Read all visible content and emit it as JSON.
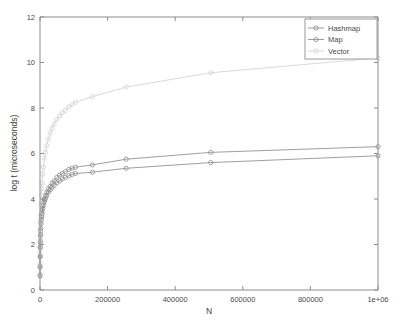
{
  "chart_data": {
    "type": "line",
    "title": "",
    "xlabel": "N",
    "ylabel": "log t (microseconds)",
    "xlim": [
      0,
      1000000
    ],
    "ylim": [
      0,
      12
    ],
    "grid": false,
    "legend_position": "top-right",
    "xticks": [
      0,
      200000,
      400000,
      600000,
      800000,
      1000000
    ],
    "xtick_labels": [
      "0",
      "200000",
      "400000",
      "600000",
      "800000",
      "1e+06"
    ],
    "yticks": [
      0,
      2,
      4,
      6,
      8,
      10,
      12
    ],
    "ytick_labels": [
      "0",
      "2",
      "4",
      "6",
      "8",
      "10",
      "12"
    ],
    "series": [
      {
        "name": "Hashmap",
        "color": "#8e8e8e",
        "marker": "circle",
        "x": [
          100,
          200,
          400,
          700,
          1000,
          1500,
          2000,
          3000,
          4000,
          5000,
          6000,
          8000,
          10000,
          13000,
          16000,
          20000,
          25000,
          30000,
          36000,
          42000,
          50000,
          58000,
          66000,
          75000,
          85000,
          95000,
          105000,
          155000,
          255000,
          505000,
          1000000
        ],
        "y": [
          0.65,
          1.05,
          1.5,
          1.9,
          2.15,
          2.45,
          2.7,
          3.0,
          3.2,
          3.35,
          3.5,
          3.7,
          3.85,
          4.0,
          4.15,
          4.3,
          4.45,
          4.55,
          4.7,
          4.8,
          4.95,
          5.05,
          5.12,
          5.2,
          5.3,
          5.35,
          5.4,
          5.5,
          5.75,
          6.05,
          6.3
        ]
      },
      {
        "name": "Map",
        "color": "#8e8e8e",
        "marker": "circle",
        "x": [
          100,
          200,
          400,
          700,
          1000,
          1500,
          2000,
          3000,
          4000,
          5000,
          6000,
          8000,
          10000,
          13000,
          16000,
          20000,
          25000,
          30000,
          36000,
          42000,
          50000,
          58000,
          66000,
          75000,
          85000,
          95000,
          105000,
          155000,
          255000,
          505000,
          1000000
        ],
        "y": [
          0.62,
          1.0,
          1.45,
          1.85,
          2.08,
          2.38,
          2.6,
          2.9,
          3.1,
          3.25,
          3.38,
          3.58,
          3.72,
          3.88,
          4.0,
          4.15,
          4.3,
          4.4,
          4.5,
          4.6,
          4.72,
          4.8,
          4.88,
          4.95,
          5.02,
          5.08,
          5.12,
          5.18,
          5.35,
          5.6,
          5.9
        ]
      },
      {
        "name": "Vector",
        "color": "#d2d2d2",
        "marker": "circle",
        "x": [
          100,
          200,
          400,
          700,
          1000,
          1500,
          2000,
          3000,
          4000,
          5000,
          6000,
          8000,
          10000,
          13000,
          16000,
          20000,
          25000,
          30000,
          36000,
          42000,
          50000,
          58000,
          66000,
          75000,
          85000,
          95000,
          105000,
          155000,
          255000,
          505000,
          1000000
        ],
        "y": [
          0.7,
          1.15,
          1.7,
          2.2,
          2.55,
          3.0,
          3.3,
          3.8,
          4.15,
          4.45,
          4.7,
          5.1,
          5.4,
          5.8,
          6.05,
          6.35,
          6.65,
          6.9,
          7.1,
          7.3,
          7.5,
          7.65,
          7.78,
          7.9,
          8.05,
          8.15,
          8.25,
          8.5,
          8.92,
          9.55,
          10.2
        ]
      }
    ]
  },
  "legend": {
    "entries": [
      {
        "label": "Hashmap"
      },
      {
        "label": "Map"
      },
      {
        "label": "Vector"
      }
    ]
  },
  "axes": {
    "x_title": "N",
    "y_title": "log t (microseconds)"
  }
}
